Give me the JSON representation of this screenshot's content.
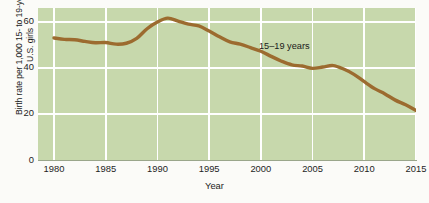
{
  "chart_data": {
    "type": "line",
    "title": "",
    "xlabel": "Year",
    "ylabel": "Birth rate per 1,000 15- to 19-year-old\nU.S. girls",
    "xlim": [
      1980,
      2015
    ],
    "ylim": [
      0,
      66
    ],
    "xticks": [
      "1980",
      "1985",
      "1990",
      "1995",
      "2000",
      "2005",
      "2010",
      "2015"
    ],
    "xtick_values": [
      1980,
      1985,
      1990,
      1995,
      2000,
      2005,
      2010,
      2015
    ],
    "yticks": [
      "0",
      "20",
      "40",
      "60"
    ],
    "ytick_values": [
      0,
      20,
      40,
      60
    ],
    "grid": "both-white",
    "legend_position": "inline-annotation",
    "plot_background": "#c7d8ac",
    "line_color": "#9c6b2f",
    "line_width": 3.4,
    "series": [
      {
        "name": "15–19 years",
        "annotation": "15–19 years",
        "x": [
          1980,
          1981,
          1982,
          1983,
          1984,
          1985,
          1986,
          1987,
          1988,
          1989,
          1990,
          1991,
          1992,
          1993,
          1994,
          1995,
          1996,
          1997,
          1998,
          1999,
          2000,
          2001,
          2002,
          2003,
          2004,
          2005,
          2006,
          2007,
          2008,
          2009,
          2010,
          2011,
          2012,
          2013,
          2014,
          2015
        ],
        "values": [
          53.0,
          52.4,
          52.2,
          51.5,
          50.9,
          51.0,
          50.3,
          50.7,
          52.8,
          57.0,
          59.9,
          61.6,
          60.3,
          59.0,
          58.2,
          56.0,
          53.5,
          51.3,
          50.3,
          48.8,
          47.2,
          45.0,
          42.9,
          41.3,
          40.8,
          39.8,
          40.4,
          41.0,
          39.5,
          37.2,
          34.0,
          31.0,
          28.7,
          26.0,
          24.0,
          21.5
        ]
      }
    ]
  }
}
